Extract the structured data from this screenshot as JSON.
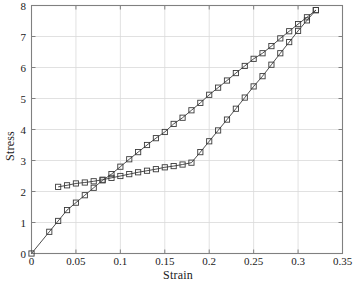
{
  "chart_data": {
    "type": "line",
    "title": "",
    "xlabel": "Strain",
    "ylabel": "Stress",
    "xlim": [
      0,
      0.35
    ],
    "ylim": [
      0,
      8
    ],
    "xticks": [
      "0",
      "0.05",
      "0.1",
      "0.15",
      "0.2",
      "0.25",
      "0.3",
      "0.35"
    ],
    "xtick_values": [
      0,
      0.05,
      0.1,
      0.15,
      0.2,
      0.25,
      0.3,
      0.35
    ],
    "yticks": [
      "0",
      "1",
      "2",
      "3",
      "4",
      "5",
      "6",
      "7",
      "8"
    ],
    "ytick_values": [
      0,
      1,
      2,
      3,
      4,
      5,
      6,
      7,
      8
    ],
    "grid": true,
    "legend": "none",
    "marker": "open-square",
    "line_color": "#3a3a3a",
    "marker_color": "#3a3a3a",
    "grid_color": "#d9d9d9",
    "axis_color": "#808080",
    "background": "#ffffff",
    "series": [
      {
        "name": "monotonic-curve",
        "marker": "open-square",
        "x": [
          0.0,
          0.02,
          0.03,
          0.04,
          0.05,
          0.06,
          0.07,
          0.08,
          0.09,
          0.1,
          0.11,
          0.12,
          0.13,
          0.14,
          0.15,
          0.16,
          0.17,
          0.18,
          0.19,
          0.2,
          0.21,
          0.22,
          0.23,
          0.24,
          0.25,
          0.26,
          0.27,
          0.28,
          0.29,
          0.3,
          0.31,
          0.32
        ],
        "y": [
          0.0,
          0.7,
          1.05,
          1.4,
          1.64,
          1.88,
          2.12,
          2.36,
          2.56,
          2.8,
          3.04,
          3.27,
          3.5,
          3.72,
          3.92,
          4.18,
          4.38,
          4.62,
          4.86,
          5.12,
          5.35,
          5.58,
          5.82,
          6.05,
          6.28,
          6.46,
          6.69,
          6.94,
          7.17,
          7.4,
          7.62,
          7.85
        ]
      },
      {
        "name": "plateau-curve",
        "marker": "open-square",
        "x": [
          0.03,
          0.04,
          0.05,
          0.06,
          0.07,
          0.08,
          0.09,
          0.1,
          0.11,
          0.12,
          0.13,
          0.14,
          0.15,
          0.16,
          0.17,
          0.18,
          0.19,
          0.2,
          0.21,
          0.22,
          0.23,
          0.24,
          0.25,
          0.26,
          0.27,
          0.28,
          0.29,
          0.3,
          0.31,
          0.32
        ],
        "y": [
          2.15,
          2.2,
          2.26,
          2.29,
          2.33,
          2.38,
          2.44,
          2.5,
          2.56,
          2.62,
          2.67,
          2.72,
          2.78,
          2.82,
          2.87,
          2.93,
          3.27,
          3.62,
          3.97,
          4.32,
          4.67,
          5.03,
          5.39,
          5.72,
          6.09,
          6.46,
          6.82,
          7.18,
          7.52,
          7.85
        ]
      }
    ]
  }
}
